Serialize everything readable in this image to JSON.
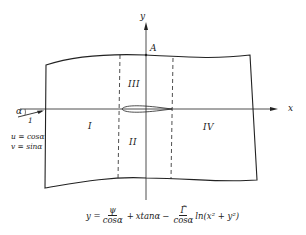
{
  "diagram": {
    "axes": {
      "x_label": "x",
      "y_label": "y",
      "point_label": "A"
    },
    "regions": [
      {
        "id": "I",
        "label": "I"
      },
      {
        "id": "II",
        "label": "II"
      },
      {
        "id": "III",
        "label": "III"
      },
      {
        "id": "IV",
        "label": "IV"
      }
    ],
    "freestream": {
      "angle_label": "α",
      "magnitude_label": "1",
      "u_eq": "u = cosα",
      "v_eq": "v = sinα"
    },
    "formula": {
      "lhs": "y =",
      "term1_num": "ψ",
      "term1_den": "cosα",
      "plus": "+",
      "term2": "xtanα",
      "minus": "−",
      "term3_num": "Γ̃",
      "term3_den": "cosα",
      "term3_tail": "ln(x² + y²)"
    },
    "colors": {
      "line": "#222222",
      "background": "#ffffff"
    }
  }
}
